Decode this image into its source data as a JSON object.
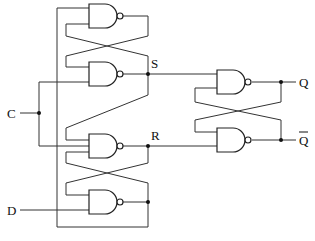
{
  "diagram": {
    "title": "",
    "type": "circuit",
    "labels": {
      "clock": "C",
      "data": "D",
      "set_node": "S",
      "reset_node": "R",
      "output": "Q",
      "output_bar": "Q"
    },
    "gates": [
      {
        "id": "g1",
        "type": "NAND",
        "role": "input-latch-top"
      },
      {
        "id": "g2",
        "type": "NAND",
        "role": "set-gate"
      },
      {
        "id": "g3",
        "type": "NAND",
        "role": "reset-gate"
      },
      {
        "id": "g4",
        "type": "NAND",
        "role": "data-gate"
      },
      {
        "id": "g5",
        "type": "NAND",
        "role": "output-latch-Q"
      },
      {
        "id": "g6",
        "type": "NAND",
        "role": "output-latch-Qbar"
      }
    ],
    "colors": {
      "line": "#333333",
      "background": "#ffffff"
    }
  }
}
